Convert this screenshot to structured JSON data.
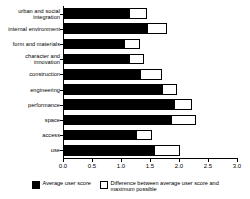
{
  "chart_data": {
    "type": "bar",
    "orientation": "horizontal",
    "stacked": true,
    "title": "",
    "subtitle": "",
    "xlabel": "",
    "ylabel": "",
    "xlim": [
      0.0,
      3.0
    ],
    "grid": false,
    "legend_position": "bottom",
    "categories": [
      "urban and social integration",
      "internal environment",
      "form and materials",
      "character and innovation",
      "construction",
      "engineering",
      "performance",
      "space",
      "access",
      "use"
    ],
    "xtick_labels": [
      "0.0",
      "0.5",
      "1.0",
      "1.5",
      "2.0",
      "2.5",
      "3.0"
    ],
    "xtick_values": [
      0.0,
      0.5,
      1.0,
      1.5,
      2.0,
      2.5,
      3.0
    ],
    "series": [
      {
        "name": "Average user score",
        "color": "#000000",
        "values": [
          1.15,
          1.47,
          1.07,
          1.15,
          1.35,
          1.72,
          1.93,
          1.88,
          1.28,
          1.59
        ]
      },
      {
        "name": "Difference between average user score and maximum possible",
        "color": "#ffffff",
        "values": [
          0.3,
          0.33,
          0.26,
          0.25,
          0.35,
          0.25,
          0.29,
          0.42,
          0.25,
          0.43
        ]
      }
    ],
    "totals": [
      1.45,
      1.8,
      1.33,
      1.4,
      1.7,
      1.97,
      2.22,
      2.3,
      1.53,
      2.02
    ]
  },
  "legend": {
    "items": [
      {
        "label": "Average user score",
        "swatch": "filled"
      },
      {
        "label": "Difference between average user score and maximum possible",
        "swatch": "hollow"
      }
    ]
  }
}
